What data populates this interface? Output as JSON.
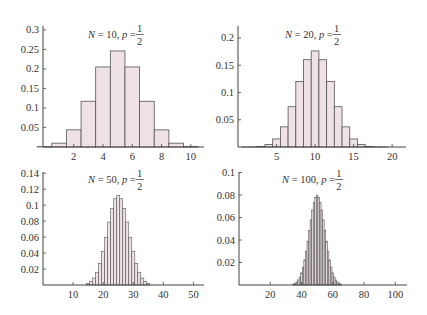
{
  "colors": {
    "bar_fill": "#eee2e4",
    "bar_stroke": "#555555",
    "axis": "#444444",
    "text": "#333333",
    "background": "#ffffff"
  },
  "chart_data": [
    {
      "type": "bar",
      "title": "N = 10, p = 1/2",
      "title_parts": {
        "n_label": "N",
        "n_value": "10",
        "p_label": "p",
        "p_num": "1",
        "p_den": "2"
      },
      "xlabel": "",
      "ylabel": "",
      "x_start": 0,
      "categories": [
        0,
        1,
        2,
        3,
        4,
        5,
        6,
        7,
        8,
        9,
        10
      ],
      "values": [
        0.001,
        0.0098,
        0.0439,
        0.1172,
        0.2051,
        0.2461,
        0.2051,
        0.1172,
        0.0439,
        0.0098,
        0.001
      ],
      "xlim": [
        -0.1,
        10.9
      ],
      "ylim": [
        0,
        0.31
      ],
      "xticks": [
        2,
        4,
        6,
        8,
        10
      ],
      "yticks": [
        0.05,
        0.1,
        0.15,
        0.2,
        0.25,
        0.3
      ],
      "ytick_labels": [
        "0.05",
        "0.1",
        "0.15",
        "0.2",
        "0.25",
        "0.3"
      ],
      "grid": false,
      "legend": null
    },
    {
      "type": "bar",
      "title": "N = 20, p = 1/2",
      "title_parts": {
        "n_label": "N",
        "n_value": "20",
        "p_label": "p",
        "p_num": "1",
        "p_den": "2"
      },
      "xlabel": "",
      "ylabel": "",
      "x_start": 0,
      "categories": [
        0,
        1,
        2,
        3,
        4,
        5,
        6,
        7,
        8,
        9,
        10,
        11,
        12,
        13,
        14,
        15,
        16,
        17,
        18,
        19,
        20
      ],
      "values": [
        1e-06,
        1.9e-05,
        0.000181,
        0.001087,
        0.004621,
        0.014786,
        0.036964,
        0.073929,
        0.120134,
        0.160179,
        0.176197,
        0.160179,
        0.120134,
        0.073929,
        0.036964,
        0.014786,
        0.004621,
        0.001087,
        0.000181,
        1.9e-05,
        1e-06
      ],
      "xlim": [
        0,
        21.8
      ],
      "ylim": [
        0,
        0.222
      ],
      "xticks": [
        5,
        10,
        15,
        20
      ],
      "yticks": [
        0.05,
        0.1,
        0.15,
        0.2
      ],
      "ytick_labels": [
        "0.05",
        "0.1",
        "0.15",
        "0.2"
      ],
      "grid": false,
      "legend": null
    },
    {
      "type": "bar",
      "title": "N = 50, p = 1/2",
      "title_parts": {
        "n_label": "N",
        "n_value": "50",
        "p_label": "p",
        "p_num": "1",
        "p_den": "2"
      },
      "xlabel": "",
      "ylabel": "",
      "x_start": 15,
      "categories": [
        15,
        16,
        17,
        18,
        19,
        20,
        21,
        22,
        23,
        24,
        25,
        26,
        27,
        28,
        29,
        30,
        31,
        32,
        33,
        34,
        35
      ],
      "values": [
        0.002,
        0.0044,
        0.0087,
        0.016,
        0.027,
        0.0419,
        0.0598,
        0.0788,
        0.096,
        0.108,
        0.1123,
        0.108,
        0.096,
        0.0788,
        0.0598,
        0.0419,
        0.027,
        0.016,
        0.0087,
        0.0044,
        0.002
      ],
      "xlim": [
        0,
        53.5
      ],
      "ylim": [
        0,
        0.1415
      ],
      "xticks": [
        10,
        20,
        30,
        40,
        50
      ],
      "yticks": [
        0.02,
        0.04,
        0.06,
        0.08,
        0.1,
        0.12,
        0.14
      ],
      "ytick_labels": [
        "0.02",
        "0.04",
        "0.06",
        "0.08",
        "0.1",
        "0.12",
        "0.14"
      ],
      "grid": false,
      "legend": null
    },
    {
      "type": "bar",
      "title": "N = 100, p = 1/2",
      "title_parts": {
        "n_label": "N",
        "n_value": "100",
        "p_label": "p",
        "p_num": "1",
        "p_den": "2"
      },
      "xlabel": "",
      "ylabel": "",
      "x_start": 35,
      "categories": [
        35,
        36,
        37,
        38,
        39,
        40,
        41,
        42,
        43,
        44,
        45,
        46,
        47,
        48,
        49,
        50,
        51,
        52,
        53,
        54,
        55,
        56,
        57,
        58,
        59,
        60,
        61,
        62,
        63,
        64,
        65
      ],
      "values": [
        0.0009,
        0.0016,
        0.0027,
        0.0045,
        0.0071,
        0.0108,
        0.0159,
        0.0223,
        0.0301,
        0.039,
        0.0485,
        0.058,
        0.0666,
        0.0735,
        0.078,
        0.0796,
        0.078,
        0.0735,
        0.0666,
        0.058,
        0.0485,
        0.039,
        0.0301,
        0.0223,
        0.0159,
        0.0108,
        0.0071,
        0.0045,
        0.0027,
        0.0016,
        0.0009
      ],
      "xlim": [
        0,
        107.5
      ],
      "ylim": [
        0,
        0.1005
      ],
      "xticks": [
        20,
        40,
        60,
        80,
        100
      ],
      "yticks": [
        0.02,
        0.04,
        0.06,
        0.08,
        0.1
      ],
      "ytick_labels": [
        "0.02",
        "0.04",
        "0.06",
        "0.08",
        "0.1"
      ],
      "grid": false,
      "legend": null
    }
  ]
}
